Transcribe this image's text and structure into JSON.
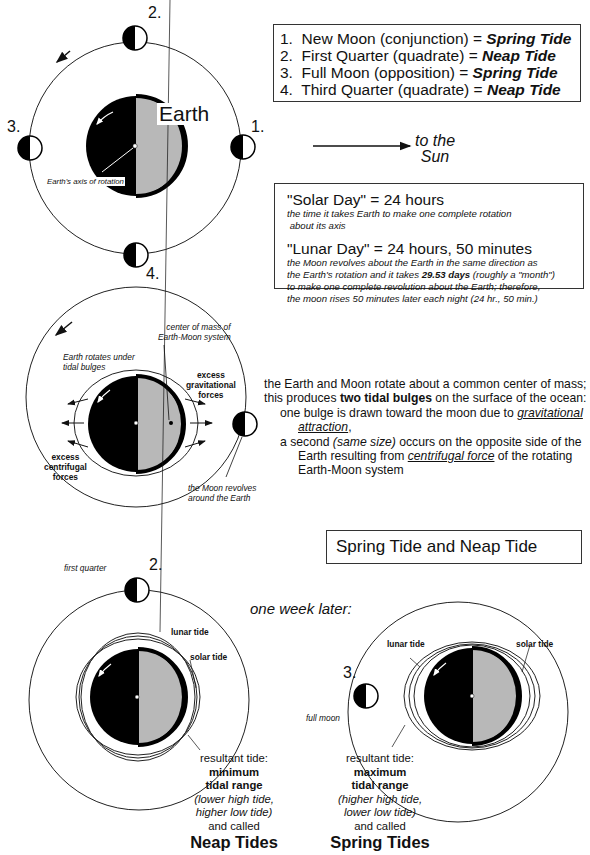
{
  "diagram1": {
    "earth_label": "Earth",
    "axis_label": "Earth's axis of rotation",
    "moon_positions": [
      "1.",
      "2.",
      "3.",
      "4."
    ],
    "sun_label_line1": "to the",
    "sun_label_line2": "Sun"
  },
  "legend": {
    "items": [
      {
        "num": "1.",
        "text": "New Moon (conjunction) = ",
        "tide": "Spring Tide"
      },
      {
        "num": "2.",
        "text": "First Quarter (quadrate) = ",
        "tide": "Neap Tide"
      },
      {
        "num": "3.",
        "text": "Full Moon (opposition) = ",
        "tide": "Spring Tide"
      },
      {
        "num": "4.",
        "text": "Third Quarter (quadrate) = ",
        "tide": "Neap Tide"
      }
    ]
  },
  "days_box": {
    "solar_title": "\"Solar Day\" = 24 hours",
    "solar_desc_1": "the time it takes Earth to make one complete rotation",
    "solar_desc_2": " about its axis",
    "lunar_title": "\"Lunar Day\" = 24 hours, 50 minutes",
    "lunar_desc_1": "the Moon revolves about the Earth in the same direction as",
    "lunar_desc_2a": "the Earth's rotation and it takes ",
    "lunar_desc_2b": "29.53 days",
    "lunar_desc_2c": " (roughly a \"month\")",
    "lunar_desc_3": "to make one complete revolution about the Earth;  therefore,",
    "lunar_desc_4": "the moon rises 50 minutes later each night (24 hr., 50 min.)"
  },
  "diagram2": {
    "center_of_mass_1": "center of mass of",
    "center_of_mass_2": "Earth-Moon system",
    "rotates_1": "Earth rotates under",
    "rotates_2": "tidal bulges",
    "grav_1": "excess",
    "grav_2": "gravitational",
    "grav_3": "forces",
    "cent_1": "excess",
    "cent_2": "centrifugal",
    "cent_3": "forces",
    "revolves_1": "the Moon revolves",
    "revolves_2": "around the Earth"
  },
  "explanation": {
    "l1": "the Earth and Moon rotate about a common center of mass;",
    "l2a": "this produces ",
    "l2b": "two tidal bulges",
    "l2c": " on the surface of the ocean:",
    "l3a": "one bulge is drawn toward the moon due to ",
    "l3b": "gravitational",
    "l4": "attraction",
    "l4c": ",",
    "l5a": "a second ",
    "l5b": "(same size)",
    "l5c": " occurs on the opposite side of the",
    "l6a": "Earth resulting from ",
    "l6b": "centrifugal force",
    "l6c": " of the rotating",
    "l7": "Earth-Moon system"
  },
  "section_title": "Spring Tide and Neap Tide",
  "one_week_later": "one week later:",
  "neap": {
    "moon_label": "first quarter",
    "moon_num": "2.",
    "lunar_tide": "lunar tide",
    "solar_tide": "solar tide",
    "resultant": "resultant tide:",
    "range_1": "minimum",
    "range_2": "tidal range",
    "detail_1": "(lower high tide,",
    "detail_2": "higher low tide)",
    "and_called": "and called",
    "name": "Neap Tides"
  },
  "spring": {
    "moon_label": "full moon",
    "moon_num": "3.",
    "lunar_tide": "lunar tide",
    "solar_tide": "solar tide",
    "resultant": "resultant tide:",
    "range_1": "maximum",
    "range_2": "tidal range",
    "detail_1": "(higher high tide,",
    "detail_2": "lower low tide)",
    "and_called": "and called",
    "name": "Spring Tides"
  },
  "colors": {
    "night": "#000000",
    "day": "#b8b8b8",
    "line": "#222222"
  }
}
